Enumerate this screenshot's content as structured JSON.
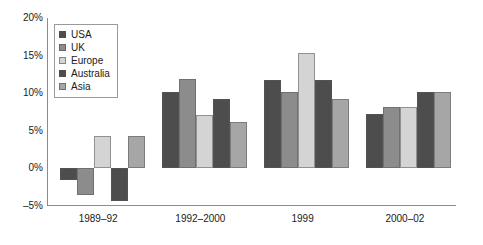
{
  "chart_data": {
    "type": "bar",
    "title": "",
    "subtitle": "",
    "xlabel": "",
    "ylabel": "",
    "ylim": [
      -5,
      20
    ],
    "yticks": [
      -5,
      0,
      5,
      10,
      15,
      20
    ],
    "ytick_labels": [
      "–5%",
      "0%",
      "5%",
      "10%",
      "15%",
      "20%"
    ],
    "grid": false,
    "legend_position": "upper-left",
    "categories": [
      "1989–92",
      "1992–2000",
      "1999",
      "2000–02"
    ],
    "series": [
      {
        "name": "USA",
        "color": "#4d4d4d",
        "values": [
          -1.5,
          10.1,
          11.8,
          7.2
        ]
      },
      {
        "name": "UK",
        "color": "#8c8c8c",
        "values": [
          -3.6,
          11.9,
          10.2,
          8.2
        ]
      },
      {
        "name": "Europe",
        "color": "#d4d4d4",
        "values": [
          4.3,
          7.1,
          15.3,
          8.2
        ]
      },
      {
        "name": "Australia",
        "color": "#4d4d4d",
        "values": [
          -4.4,
          9.2,
          11.8,
          10.1
        ]
      },
      {
        "name": "Asia",
        "color": "#a6a6a6",
        "values": [
          4.3,
          6.2,
          9.2,
          10.1
        ]
      }
    ]
  }
}
